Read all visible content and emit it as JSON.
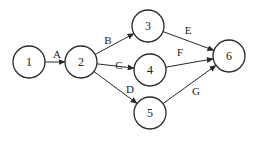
{
  "diagram": {
    "type": "activity-on-arrow network",
    "nodes": [
      {
        "id": "1",
        "label": "1",
        "x": 29,
        "y": 62
      },
      {
        "id": "2",
        "label": "2",
        "x": 81,
        "y": 62
      },
      {
        "id": "3",
        "label": "3",
        "x": 148,
        "y": 26
      },
      {
        "id": "4",
        "label": "4",
        "x": 150,
        "y": 70
      },
      {
        "id": "5",
        "label": "5",
        "x": 150,
        "y": 113
      },
      {
        "id": "6",
        "label": "6",
        "x": 229,
        "y": 56
      }
    ],
    "node_radius": 16,
    "edges": [
      {
        "from": "1",
        "to": "2",
        "label": "A",
        "label_x": 57,
        "label_y": 54
      },
      {
        "from": "2",
        "to": "3",
        "label": "B",
        "label_x": 108,
        "label_y": 40
      },
      {
        "from": "2",
        "to": "4",
        "label": "C",
        "label_x": 119,
        "label_y": 65
      },
      {
        "from": "2",
        "to": "5",
        "label": "D",
        "label_x": 130,
        "label_y": 89
      },
      {
        "from": "3",
        "to": "6",
        "label": "E",
        "label_x": 188,
        "label_y": 30
      },
      {
        "from": "4",
        "to": "6",
        "label": "F",
        "label_x": 180,
        "label_y": 52
      },
      {
        "from": "5",
        "to": "6",
        "label": "G",
        "label_x": 196,
        "label_y": 91
      }
    ],
    "colors": {
      "stroke": "#2a2a2a",
      "text": "#222222",
      "background": "#ffffff"
    }
  }
}
